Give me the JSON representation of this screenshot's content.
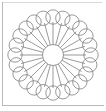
{
  "figure": {
    "style": "black-and-white outline coloring page",
    "background_color": "#ffffff",
    "stroke_color": "#6e6e6e",
    "fill_color": "none",
    "stroke_width": 0.7,
    "canvas": {
      "width": 106,
      "height": 111
    },
    "center": {
      "x": 53,
      "y": 55
    },
    "center_circle": {
      "radius": 10.5
    },
    "spokes": {
      "count": 24,
      "inner_radius": 10.5,
      "outer_radius": 33
    },
    "ring_circles": {
      "count": 24,
      "orbit_radius": 38,
      "radius": 7.2
    },
    "border": {
      "left_color": "#b8b8b8",
      "top_color": "#d8d8d8",
      "bottom_color": "#b8b8b8"
    }
  }
}
